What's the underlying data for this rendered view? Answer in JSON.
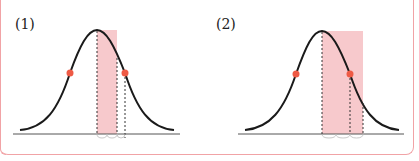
{
  "panels": [
    {
      "label": "(1)",
      "peak_x": 97,
      "dots": [
        70,
        125
      ],
      "shade": [
        97,
        117
      ],
      "dashed": [
        97,
        117,
        125
      ]
    },
    {
      "label": "(2)",
      "peak_x": 322,
      "dots": [
        296,
        350
      ],
      "shade": [
        322,
        363
      ],
      "dashed": [
        322,
        350,
        363
      ]
    }
  ],
  "colors": {
    "curve": "#1a1a1a",
    "shade": "#f7c9cc",
    "dot": "#ee5a45",
    "frame": "#f1a3a6",
    "brace": "#bbbbbb"
  }
}
